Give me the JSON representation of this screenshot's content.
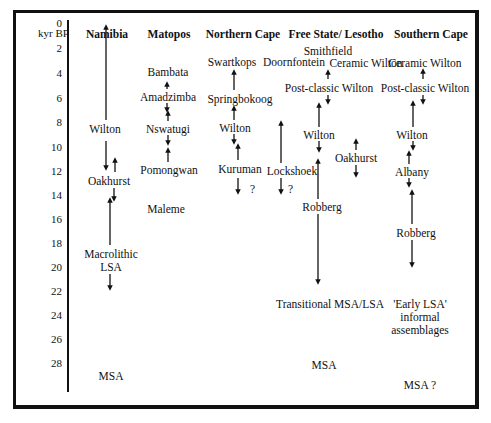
{
  "axis": {
    "label": "kyr BP",
    "ticks": [
      "0",
      "2",
      "4",
      "6",
      "8",
      "10",
      "12",
      "14",
      "16",
      "18",
      "20",
      "22",
      "24",
      "26",
      "28"
    ]
  },
  "columns": [
    {
      "name": "Namibia"
    },
    {
      "name": "Matopos"
    },
    {
      "name": "Northern Cape"
    },
    {
      "name": "Free State/ Lesotho"
    },
    {
      "name": "Southern Cape"
    }
  ],
  "labels": {
    "namibia": {
      "wilton": "Wilton",
      "oakhurst": "Oakhurst",
      "macrolithic_1": "Macrolithic",
      "macrolithic_2": "LSA",
      "msa": "MSA"
    },
    "matopos": {
      "bambata": "Bambata",
      "amadzimba": "Amadzimba",
      "nswatugi": "Nswatugi",
      "pomongwan": "Pomongwan",
      "maleme": "Maleme"
    },
    "northern_cape": {
      "swartkops": "Swartkops",
      "doornfontein": "Doornfontein",
      "springbokoog": "Springbokoog",
      "wilton": "Wilton",
      "kuruman": "Kuruman",
      "kuruman_q": "?",
      "lockshoek": "Lockshoek",
      "lockshoek_q": "?"
    },
    "free_state": {
      "smithfield": "Smithfield",
      "ceramic_wilton": "Ceramic Wilton",
      "post_classic_wilton": "Post-classic Wilton",
      "wilton": "Wilton",
      "oakhurst": "Oakhurst",
      "robberg": "Robberg",
      "transitional": "Transitional MSA/LSA",
      "msa": "MSA"
    },
    "southern_cape": {
      "ceramic_wilton": "Ceramic Wilton",
      "post_classic_wilton": "Post-classic Wilton",
      "wilton": "Wilton",
      "albany": "Albany",
      "robberg": "Robberg",
      "early_lsa_1": "'Early LSA'",
      "early_lsa_2": "informal",
      "early_lsa_3": "assemblages",
      "msa": "MSA ?"
    }
  }
}
